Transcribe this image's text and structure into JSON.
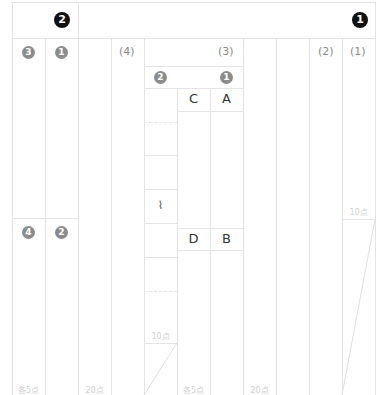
{
  "sheet": {
    "header": {
      "left_badge": "2",
      "right_badge": "1"
    },
    "section_2": {
      "col_badges_top": [
        "3",
        "1"
      ],
      "col_badges_bottom": [
        "4",
        "2"
      ],
      "part_labels": [
        "(4)"
      ],
      "points": [
        "各5点",
        "20点"
      ]
    },
    "section_1": {
      "part_labels": [
        "(3)",
        "(2)",
        "(1)"
      ],
      "sub_badges": [
        "2",
        "1"
      ],
      "letters_top": [
        "C",
        "A"
      ],
      "letters_bottom": [
        "D",
        "B"
      ],
      "squiggle": "⌇",
      "points_10_left": "10点",
      "points_10_right": "10点",
      "points": [
        "各5点",
        "20点"
      ]
    },
    "colors": {
      "grid": "#e4e4e4",
      "badge_gray": "#8c8c8c",
      "badge_black": "#111111",
      "points_text": "#d0d0d0"
    }
  }
}
